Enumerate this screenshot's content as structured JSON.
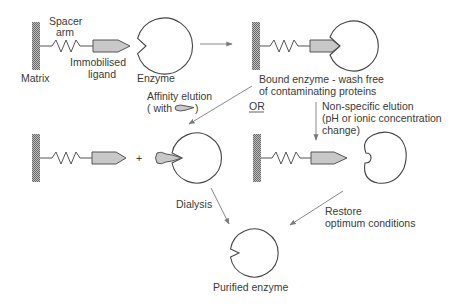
{
  "labels": {
    "spacer_arm_1": "Spacer",
    "spacer_arm_2": "arm",
    "matrix": "Matrix",
    "immobilised_ligand_1": "Immobilised",
    "immobilised_ligand_2": "ligand",
    "enzyme": "Enzyme",
    "bound_enzyme_1": "Bound enzyme - wash free",
    "bound_enzyme_2": "of contaminating proteins",
    "affinity_elution_1": "Affinity elution",
    "affinity_elution_2_pre": "( with",
    "affinity_elution_2_post": ")",
    "or": "OR",
    "nonspecific_1": "Non-specific elution",
    "nonspecific_2": "(pH or ionic concentration",
    "nonspecific_3": "change)",
    "plus": "+",
    "dialysis": "Dialysis",
    "restore_1": "Restore",
    "restore_2": "optimum conditions",
    "purified_enzyme": "Purified enzyme"
  },
  "colors": {
    "ligand_fill": "#c8c8c8",
    "outline": "#444444",
    "arrow": "#7a7a7a",
    "text": "#3a3a3a",
    "background": "#ffffff"
  },
  "icons": {
    "matrix": "hatched-bar",
    "spacer": "zigzag-spring",
    "ligand": "pointed-bullet",
    "enzyme": "notched-circle",
    "free_ligand": "soluble-ligand-blob"
  }
}
